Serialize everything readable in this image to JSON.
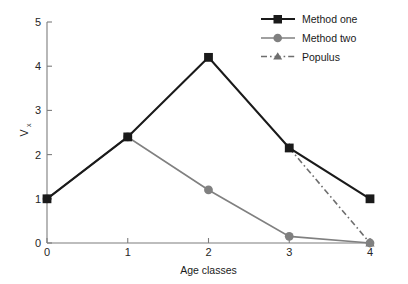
{
  "chart_data": {
    "type": "line",
    "title": "",
    "xlabel": "Age classes",
    "ylabel": "V",
    "ylabel_sub": "x",
    "x": [
      0,
      1,
      2,
      3,
      4
    ],
    "xticklabels": [
      "0",
      "1",
      "2",
      "3",
      "4"
    ],
    "yticklabels": [
      "0",
      "1",
      "2",
      "3",
      "4",
      "5"
    ],
    "xlim": [
      0,
      4
    ],
    "ylim": [
      0,
      5
    ],
    "grid": false,
    "legend_position": "top-right",
    "series": [
      {
        "name": "Method one",
        "color": "#1a1a1a",
        "marker": "square",
        "linestyle": "solid",
        "x": [
          0,
          1,
          2,
          3,
          4
        ],
        "values": [
          1.0,
          2.4,
          4.2,
          2.15,
          1.0
        ]
      },
      {
        "name": "Method two",
        "color": "#808080",
        "marker": "circle",
        "linestyle": "solid",
        "x": [
          0,
          1,
          2,
          3,
          4
        ],
        "values": [
          1.0,
          2.4,
          1.2,
          0.15,
          0.0
        ]
      },
      {
        "name": "Populus",
        "color": "#6e6e6e",
        "marker": "triangle",
        "linestyle": "dashdot",
        "x": [
          3,
          4
        ],
        "values": [
          2.15,
          0.0
        ]
      }
    ]
  },
  "legend": {
    "items": [
      {
        "label": "Method one"
      },
      {
        "label": "Method two"
      },
      {
        "label": "Populus"
      }
    ]
  },
  "axes": {
    "x_title": "Age classes",
    "y_title": "V",
    "y_title_sub": "x",
    "x_ticks": [
      "0",
      "1",
      "2",
      "3",
      "4"
    ],
    "y_ticks": [
      "0",
      "1",
      "2",
      "3",
      "4",
      "5"
    ]
  },
  "colors": {
    "series_one": "#1a1a1a",
    "series_two": "#808080",
    "series_three": "#6e6e6e",
    "axis": "#7d7d7d",
    "background": "#ffffff"
  }
}
